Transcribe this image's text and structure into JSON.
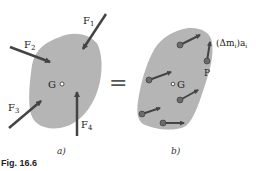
{
  "figure": {
    "caption": "Fig. 16.6",
    "equals_sign": "=",
    "colors": {
      "body_fill": "#b5b5b5",
      "arrow": "#444444",
      "particle": "#6a6a6a"
    }
  },
  "panel_a": {
    "label": "a)",
    "center_label": "G",
    "forces": [
      {
        "name": "F",
        "sub": "1"
      },
      {
        "name": "F",
        "sub": "2"
      },
      {
        "name": "F",
        "sub": "3"
      },
      {
        "name": "F",
        "sub": "4"
      }
    ]
  },
  "panel_b": {
    "label": "b)",
    "center_label": "G",
    "point_label": "P",
    "effective_force_label": "(Δm",
    "effective_force_sub": "i",
    "effective_force_tail": ")a",
    "effective_force_sub2": "i"
  }
}
